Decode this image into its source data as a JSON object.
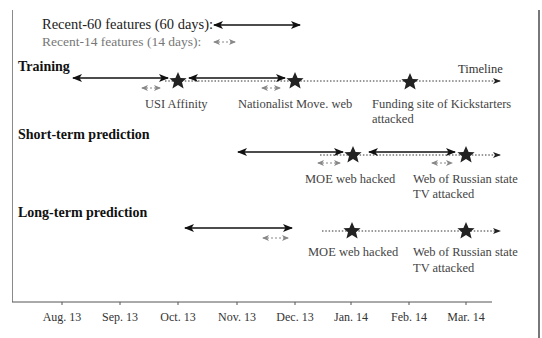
{
  "legend": {
    "recent60": "Recent-60 features (60 days):",
    "recent14": "Recent-14 features (14 days):"
  },
  "sections": {
    "training": {
      "title": "Training",
      "timeline_label": "Timeline",
      "events": [
        {
          "label": "USI Affinity",
          "label2": ""
        },
        {
          "label": "Nationalist Move. web",
          "label2": ""
        },
        {
          "label": "Funding site of Kickstarters",
          "label2": "attacked"
        }
      ]
    },
    "short_term": {
      "title": "Short-term prediction",
      "events": [
        {
          "label": "MOE web hacked",
          "label2": ""
        },
        {
          "label": "Web of Russian state",
          "label2": "TV attacked"
        }
      ]
    },
    "long_term": {
      "title": "Long-term prediction",
      "events": [
        {
          "label": "MOE web hacked",
          "label2": ""
        },
        {
          "label": "Web of Russian state",
          "label2": "TV attacked"
        }
      ]
    }
  },
  "axis": {
    "ticks": [
      "Aug. 13",
      "Sep. 13",
      "Oct. 13",
      "Nov. 13",
      "Dec. 13",
      "Jan. 14",
      "Feb. 14",
      "Mar. 14"
    ]
  },
  "colors": {
    "solid_arrow": "#111111",
    "dashed_arrow": "#888888",
    "star": "#222222",
    "axis": "#555555"
  }
}
